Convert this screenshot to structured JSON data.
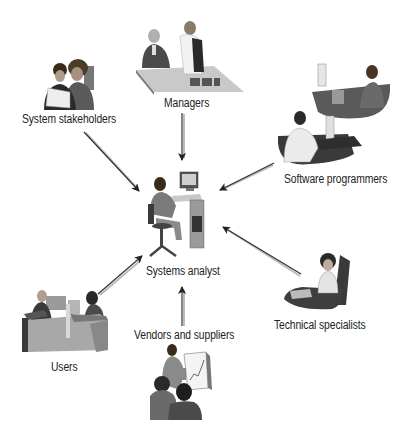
{
  "diagram": {
    "center": {
      "label": "Systems analyst"
    },
    "nodes": [
      {
        "id": "managers",
        "label": "Managers"
      },
      {
        "id": "system-stakeholders",
        "label": "System stakeholders"
      },
      {
        "id": "software-programmers",
        "label": "Software programmers"
      },
      {
        "id": "technical-specialists",
        "label": "Technical specialists"
      },
      {
        "id": "vendors-and-suppliers",
        "label": "Vendors and suppliers"
      },
      {
        "id": "users",
        "label": "Users"
      }
    ],
    "edges": [
      {
        "from": "managers",
        "to": "systems-analyst"
      },
      {
        "from": "system-stakeholders",
        "to": "systems-analyst"
      },
      {
        "from": "software-programmers",
        "to": "systems-analyst"
      },
      {
        "from": "technical-specialists",
        "to": "systems-analyst"
      },
      {
        "from": "vendors-and-suppliers",
        "to": "systems-analyst"
      },
      {
        "from": "users",
        "to": "systems-analyst"
      }
    ],
    "colors": {
      "arrow": "#333333",
      "arrow_shadow": "#bbbbbb",
      "figure_dark": "#4a4a4a",
      "figure_mid": "#8a8a8a",
      "figure_light": "#d2d2d2"
    }
  }
}
